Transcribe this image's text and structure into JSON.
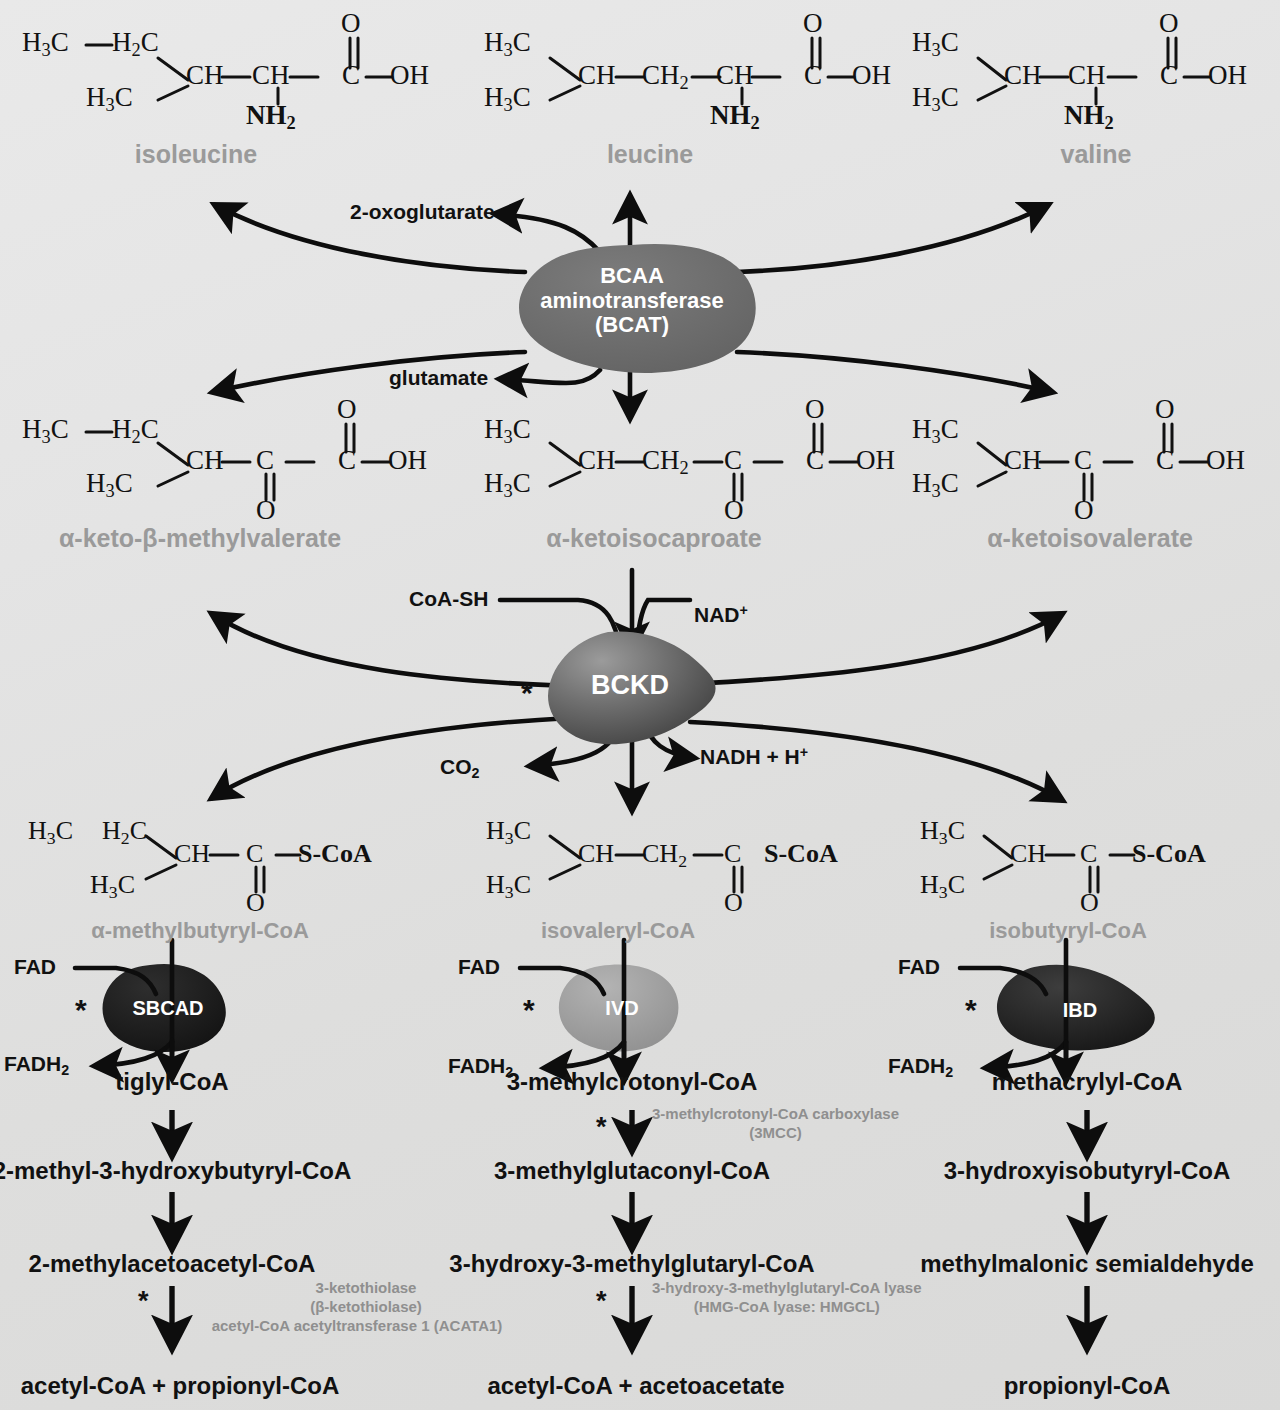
{
  "diagram": {
    "background_color": "#e4e4e3",
    "gray_label_color": "#9a9a9a",
    "black_label_color": "#111111",
    "annotation_color": "#8f8f8f"
  },
  "amino_acids": [
    {
      "name": "isoleucine",
      "formula_html": "H<sub>3</sub>C&#8212;H<sub>2</sub>C &#92; CH&#8212;CH&#8212;C(=O)&#8212;OH / H<sub>3</sub>C ; NH<sub>2</sub>"
    },
    {
      "name": "leucine",
      "formula_html": "H<sub>3</sub>C &#92; CH&#8212;CH<sub>2</sub>&#8212;CH&#8212;C(=O)&#8212;OH / H<sub>3</sub>C ; NH<sub>2</sub>"
    },
    {
      "name": "valine",
      "formula_html": "H<sub>3</sub>C &#92; CH&#8212;CH&#8212;C(=O)&#8212;OH / H<sub>3</sub>C ; NH<sub>2</sub>"
    }
  ],
  "keto_acids": [
    {
      "name": "α-keto-β-methylvalerate"
    },
    {
      "name": "α-ketoisocaproate"
    },
    {
      "name": "α-ketoisovalerate"
    }
  ],
  "acyl_coas": [
    {
      "name": "α-methylbutyryl-CoA"
    },
    {
      "name": "isovaleryl-CoA"
    },
    {
      "name": "isobutyryl-CoA"
    }
  ],
  "enzymes": [
    {
      "id": "bcat",
      "lines": [
        "BCAA",
        "aminotransferase",
        "(BCAT)"
      ],
      "shape": "blob",
      "fill": "#6e6e6e",
      "starred": false
    },
    {
      "id": "bckd",
      "lines": [
        "BCKD"
      ],
      "shape": "teardrop",
      "fill": "#5a5a5a",
      "starred": true
    },
    {
      "id": "sbcad",
      "lines": [
        "SBCAD"
      ],
      "shape": "blob",
      "fill": "#1d1d1d",
      "starred": true
    },
    {
      "id": "ivd",
      "lines": [
        "IVD"
      ],
      "shape": "blob",
      "fill": "#9d9d9d",
      "starred": true
    },
    {
      "id": "ibd",
      "lines": [
        "IBD"
      ],
      "shape": "blob",
      "fill": "#2a2a2a",
      "starred": true
    }
  ],
  "cofactors": {
    "bcat_in": "2-oxoglutarate",
    "bcat_out": "glutamate",
    "bckd_coa": "CoA-SH",
    "bckd_nad": "NAD",
    "bckd_nad_sup": "+",
    "bckd_co2": "CO",
    "bckd_co2_sub": "2",
    "bckd_nadh": "NADH + H",
    "bckd_nadh_sup": "+",
    "fad": "FAD",
    "fadh2": "FADH",
    "fadh2_sub": "2"
  },
  "columns": [
    {
      "id": "isoleucine-branch",
      "steps": [
        {
          "label": "tiglyl-CoA"
        },
        {
          "label": "2-methyl-3-hydroxybutyryl-CoA"
        },
        {
          "label": "2-methylacetoacetyl-CoA"
        },
        {
          "label": "acetyl-CoA  +  propionyl-CoA"
        }
      ],
      "annotations": [
        {
          "lines": [
            "3-ketothiolase",
            "(β-ketothiolase)",
            "acetyl-CoA acetyltransferase 1 (ACATA1)"
          ],
          "starred": true
        }
      ]
    },
    {
      "id": "leucine-branch",
      "steps": [
        {
          "label": "3-methylcrotonyl-CoA"
        },
        {
          "label": "3-methylglutaconyl-CoA"
        },
        {
          "label": "3-hydroxy-3-methylglutaryl-CoA"
        },
        {
          "label": "acetyl-CoA  +  acetoacetate"
        }
      ],
      "annotations": [
        {
          "lines": [
            "3-methylcrotonyl-CoA carboxylase",
            "(3MCC)"
          ],
          "starred": true
        },
        {
          "lines": [
            "3-hydroxy-3-methylglutaryl-CoA lyase",
            "(HMG-CoA lyase: HMGCL)"
          ],
          "starred": true
        }
      ]
    },
    {
      "id": "valine-branch",
      "steps": [
        {
          "label": "methacrylyl-CoA"
        },
        {
          "label": "3-hydroxyisobutyryl-CoA"
        },
        {
          "label": "methylmalonic semialdehyde"
        },
        {
          "label": "propionyl-CoA"
        }
      ],
      "annotations": []
    }
  ],
  "structure_atoms": {
    "h3c": "H",
    "h3c_sub": "3",
    "h3c_c": "C",
    "h2c": "H",
    "h2c_sub": "2",
    "h2c_c": "C",
    "ch": "CH",
    "ch2": "CH",
    "ch2_sub": "2",
    "c": "C",
    "o": "O",
    "oh": "OH",
    "nh2": "NH",
    "nh2_sub": "2",
    "scoa": "S-CoA",
    "dash": "—"
  }
}
